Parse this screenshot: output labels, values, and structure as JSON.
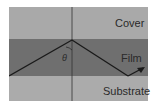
{
  "layers": {
    "cover": "Cover",
    "film": "Film",
    "substrate": "Substrate"
  },
  "angle_label": "θ",
  "colors": {
    "cover": "#a9a9a9",
    "film": "#6f6f6f",
    "substrate": "#ababab",
    "ray": "#1a1a1a"
  }
}
